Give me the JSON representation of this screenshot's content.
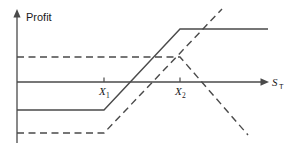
{
  "figure": {
    "title": "",
    "background_color": "#ffffff",
    "line_color": "#4a4a4a",
    "text_color": "#1a1a1a",
    "width": 296,
    "height": 148
  },
  "axes": {
    "y_axis": {
      "label": "Profit",
      "label_x": 26,
      "label_y": 20,
      "x": 17,
      "top": 11,
      "bottom": 143,
      "arrow": "up-arrow-icon"
    },
    "x_axis": {
      "label_main": "S",
      "label_sub": "T",
      "label_x": 272,
      "label_y": 85,
      "y": 82,
      "left": 17,
      "right": 268,
      "arrow": "right-arrow-icon"
    },
    "ticks": [
      {
        "label_main": "X",
        "label_sub": "1",
        "x": 104,
        "label_y": 95
      },
      {
        "label_main": "X",
        "label_sub": "2",
        "x": 180,
        "label_y": 95
      }
    ]
  },
  "chart_data": {
    "type": "line",
    "title": "",
    "xlabel": "S_T",
    "ylabel": "Profit",
    "xlim": [
      17,
      268
    ],
    "ylim": [
      143,
      11
    ],
    "grid": false,
    "legend": "none",
    "zero_line_y": 82,
    "annotations": [
      "X1 = 104",
      "X2 = 180"
    ],
    "series": [
      {
        "name": "bull-spread-profit",
        "style": "solid",
        "points": [
          [
            17,
            110
          ],
          [
            104,
            110
          ],
          [
            180,
            29
          ],
          [
            268,
            29
          ]
        ]
      },
      {
        "name": "long-call-payoff-lower-dashed",
        "style": "dashed",
        "points": [
          [
            17,
            133
          ],
          [
            104,
            133
          ],
          [
            222,
            9
          ]
        ]
      },
      {
        "name": "short-call-payoff-upper-dashed",
        "style": "dashed",
        "points": [
          [
            17,
            57
          ],
          [
            180,
            57
          ],
          [
            248,
            135
          ]
        ]
      }
    ]
  }
}
